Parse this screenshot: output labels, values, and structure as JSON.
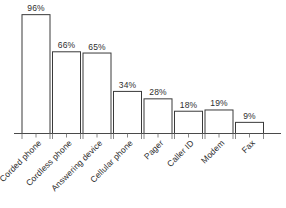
{
  "chart_data": {
    "type": "bar",
    "title": "",
    "subtitle": "",
    "xlabel": "",
    "ylabel": "",
    "ylim": [
      0,
      100
    ],
    "grid": false,
    "legend": false,
    "categories": [
      "Corded phone",
      "Cordless phone",
      "Answering device",
      "Cellular phone",
      "Pager",
      "Caller ID",
      "Modem",
      "Fax"
    ],
    "values": [
      96,
      66,
      65,
      34,
      28,
      18,
      19,
      9
    ],
    "data_labels": [
      "96%",
      "66%",
      "65%",
      "34%",
      "28%",
      "18%",
      "19%",
      "9%"
    ],
    "series": [
      {
        "name": "Percent of households",
        "values": [
          96,
          66,
          65,
          34,
          28,
          18,
          19,
          9
        ]
      }
    ],
    "colors": {
      "bar_fill": "#ffffff",
      "bar_stroke": "#3a3a3a",
      "axis": "#4a4a4a",
      "text": "#2e2e2e",
      "background": "#ffffff"
    }
  }
}
